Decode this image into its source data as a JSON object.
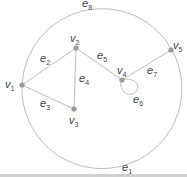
{
  "diagram": {
    "type": "graph",
    "colors": {
      "edge": "#bdbdbd",
      "vertex": "#9a9a9a",
      "label": "#444444"
    },
    "vertices": [
      {
        "id": "v1",
        "label": "v",
        "sub": "1"
      },
      {
        "id": "v2",
        "label": "v",
        "sub": "2"
      },
      {
        "id": "v3",
        "label": "v",
        "sub": "3"
      },
      {
        "id": "v4",
        "label": "v",
        "sub": "4"
      },
      {
        "id": "v5",
        "label": "v",
        "sub": "5"
      }
    ],
    "edges": [
      {
        "id": "e1",
        "label": "e",
        "sub": "1",
        "from": "v1",
        "to": "v5",
        "shape": "lower arc"
      },
      {
        "id": "e2",
        "label": "e",
        "sub": "2",
        "from": "v1",
        "to": "v2"
      },
      {
        "id": "e3",
        "label": "e",
        "sub": "3",
        "from": "v1",
        "to": "v3"
      },
      {
        "id": "e4",
        "label": "e",
        "sub": "4",
        "from": "v2",
        "to": "v3"
      },
      {
        "id": "e5",
        "label": "e",
        "sub": "5",
        "from": "v2",
        "to": "v4"
      },
      {
        "id": "e6",
        "label": "e",
        "sub": "6",
        "from": "v4",
        "to": "v4",
        "shape": "loop"
      },
      {
        "id": "e7",
        "label": "e",
        "sub": "7",
        "from": "v4",
        "to": "v5"
      },
      {
        "id": "e8",
        "label": "e",
        "sub": "8",
        "from": "v1",
        "to": "v5",
        "shape": "upper arc"
      }
    ]
  }
}
